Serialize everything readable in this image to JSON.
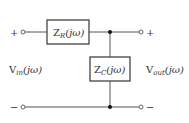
{
  "diagram": {
    "type": "circuit",
    "colors": {
      "wire": "#555555",
      "box_stroke": "#444444",
      "text": "#333333",
      "background": "#ffffff"
    },
    "components": {
      "series": {
        "symbol": "Z",
        "subscript": "R",
        "argument": "(jω)"
      },
      "shunt": {
        "symbol": "Z",
        "subscript": "C",
        "argument": "(jω)"
      }
    },
    "labels": {
      "vin": {
        "symbol": "V",
        "subscript": "in",
        "argument": "(jω)"
      },
      "vout": {
        "symbol": "V",
        "subscript": "out",
        "argument": "(jω)"
      }
    },
    "terminals": {
      "in_plus": "+",
      "in_minus": "−",
      "out_plus": "+",
      "out_minus": "−"
    }
  }
}
